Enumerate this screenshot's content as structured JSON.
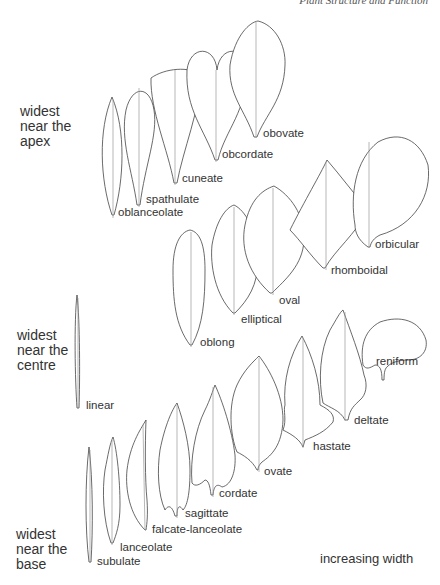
{
  "header": {
    "running_title": "Plant Structure and Function"
  },
  "groups": [
    {
      "id": "apex",
      "label_lines": [
        "widest",
        "near the",
        "apex"
      ],
      "shapes": [
        "oblanceolate",
        "spathulate",
        "cuneate",
        "obcordate",
        "obovate"
      ]
    },
    {
      "id": "centre",
      "label_lines": [
        "widest",
        "near the",
        "centre"
      ],
      "shapes": [
        "linear",
        "oblong",
        "elliptical",
        "oval",
        "rhomboidal",
        "orbicular"
      ]
    },
    {
      "id": "base",
      "label_lines": [
        "widest",
        "near the",
        "base"
      ],
      "shapes": [
        "subulate",
        "lanceolate",
        "falcate-lanceolate",
        "sagittate",
        "cordate",
        "ovate",
        "hastate",
        "deltate",
        "reniform"
      ]
    }
  ],
  "labels": {
    "oblanceolate": "oblanceolate",
    "spathulate": "spathulate",
    "cuneate": "cuneate",
    "obcordate": "obcordate",
    "obovate": "obovate",
    "linear": "linear",
    "oblong": "oblong",
    "elliptical": "elliptical",
    "oval": "oval",
    "rhomboidal": "rhomboidal",
    "orbicular": "orbicular",
    "subulate": "subulate",
    "lanceolate": "lanceolate",
    "falcate_lanceolate": "falcate-lanceolate",
    "sagittate": "sagittate",
    "cordate": "cordate",
    "ovate": "ovate",
    "hastate": "hastate",
    "deltate": "deltate",
    "reniform": "reniform"
  },
  "axis_note": "increasing width"
}
